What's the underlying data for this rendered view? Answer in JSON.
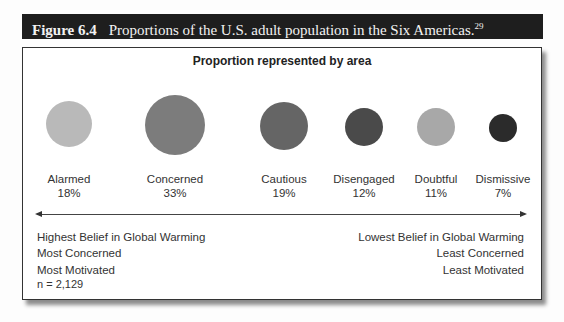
{
  "figure": {
    "number": "Figure 6.4",
    "caption": "Proportions of the U.S. adult population in the Six Americas.",
    "footnote": "29"
  },
  "chart": {
    "title": "Proportion represented by area",
    "segments": [
      {
        "name": "Alarmed",
        "percent": "18%",
        "color": "#b9b9b9",
        "cx": 46,
        "cy": 76,
        "r": 23
      },
      {
        "name": "Concerned",
        "percent": "33%",
        "color": "#7c7c7c",
        "cx": 152,
        "cy": 77,
        "r": 30
      },
      {
        "name": "Cautious",
        "percent": "19%",
        "color": "#656565",
        "cx": 261,
        "cy": 78,
        "r": 24
      },
      {
        "name": "Disengaged",
        "percent": "12%",
        "color": "#4a4a4a",
        "cx": 341,
        "cy": 79,
        "r": 19
      },
      {
        "name": "Doubtful",
        "percent": "11%",
        "color": "#a8a8a8",
        "cx": 413,
        "cy": 79,
        "r": 19
      },
      {
        "name": "Dismissive",
        "percent": "7%",
        "color": "#2b2b2b",
        "cx": 480,
        "cy": 80,
        "r": 14
      }
    ],
    "left_text": [
      "Highest Belief in Global Warming",
      "Most Concerned",
      "Most Motivated"
    ],
    "right_text": [
      "Lowest Belief in Global Warming",
      "Least Concerned",
      "Least Motivated"
    ],
    "sample_size": "n = 2,129"
  },
  "chart_data": {
    "type": "bubble",
    "title": "Proportion represented by area",
    "categories": [
      "Alarmed",
      "Concerned",
      "Cautious",
      "Disengaged",
      "Doubtful",
      "Dismissive"
    ],
    "values": [
      18,
      33,
      19,
      12,
      11,
      7
    ],
    "unit": "%",
    "axis_left_label": [
      "Highest Belief in Global Warming",
      "Most Concerned",
      "Most Motivated"
    ],
    "axis_right_label": [
      "Lowest Belief in Global Warming",
      "Least Concerned",
      "Least Motivated"
    ],
    "annotation": "n = 2,129",
    "grid": false,
    "legend": "none"
  }
}
